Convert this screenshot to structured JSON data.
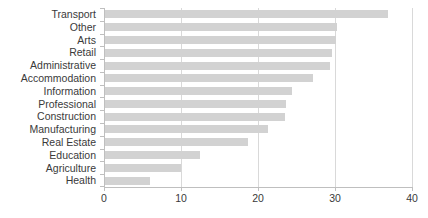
{
  "chart_data": {
    "type": "bar",
    "orientation": "horizontal",
    "title": "",
    "subtitle": "",
    "xlabel": "",
    "ylabel": "",
    "xlim": [
      0,
      40
    ],
    "ylim": null,
    "xticks": [
      0,
      10,
      20,
      30,
      40
    ],
    "xtick_labels": [
      "0",
      "10",
      "20",
      "30",
      "40"
    ],
    "grid": "vertical",
    "legend": false,
    "legend_position": "none",
    "bar_color": "#d2d2d2",
    "axis_color": "#bfbfbf",
    "gridline_color": "#d9d9d9",
    "text_color": "#3a3a3a",
    "background": "#ffffff",
    "categories": [
      "Transport",
      "Other",
      "Arts",
      "Retail",
      "Administrative",
      "Accommodation",
      "Information",
      "Professional",
      "Construction",
      "Manufacturing",
      "Real Estate",
      "Education",
      "Agriculture",
      "Health"
    ],
    "values": [
      36.9,
      30.3,
      30.1,
      29.6,
      29.4,
      27.1,
      24.4,
      23.6,
      23.5,
      21.3,
      18.7,
      12.5,
      10.0,
      6.0
    ]
  }
}
